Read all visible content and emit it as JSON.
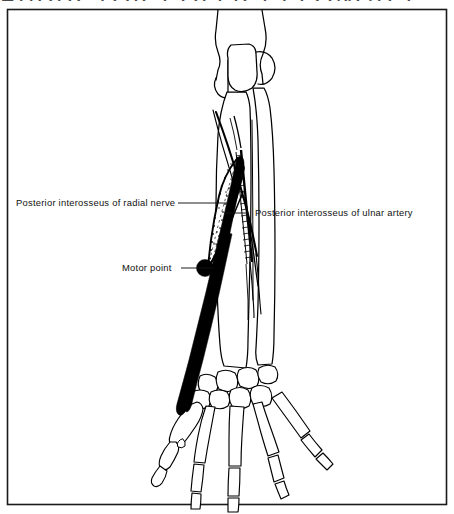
{
  "figure": {
    "cut_off_title": "ABDUCTOR POLLICIS LONGUS",
    "frame_color": "#1a1a1a",
    "ink_color": "#000000",
    "background_color": "#ffffff",
    "frame": {
      "x": 7,
      "y": 9,
      "width": 440,
      "height": 496
    }
  },
  "labels": {
    "radial_nerve": "Posterior interosseus of radial nerve",
    "ulnar_artery": "Posterior interosseus of ulnar artery",
    "motor_point": "Motor  point"
  },
  "anatomy": {
    "view": "posterior forearm and hand, skeletal outline",
    "structures": [
      "humerus distal end",
      "radius",
      "ulna",
      "carpal bones",
      "metacarpals",
      "proximal phalanges",
      "middle phalanges",
      "distal phalanges",
      "abductor pollicis longus muscle belly",
      "abductor pollicis longus tendon",
      "posterior interosseous nerve",
      "posterior interosseous artery"
    ],
    "motor_point_marker": {
      "x": 205,
      "y": 268,
      "radius": 8.5,
      "fill": "#000000"
    }
  },
  "leaders": {
    "radial_nerve": {
      "from_x": 178,
      "from_y": 203,
      "to_x": 228,
      "to_y": 203
    },
    "ulnar_artery": {
      "from_x": 247,
      "from_y": 213,
      "to_x": 224,
      "to_y": 213
    },
    "motor_point": {
      "from_x": 181,
      "from_y": 268,
      "to_x": 214,
      "to_y": 268
    }
  }
}
